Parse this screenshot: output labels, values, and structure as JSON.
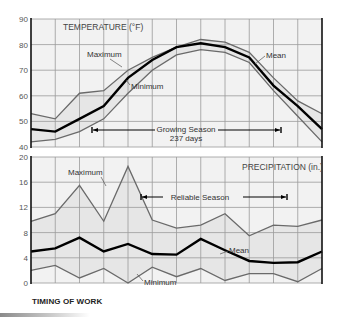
{
  "caption": "TIMING OF WORK",
  "chart_data": [
    {
      "type": "line",
      "title": "TEMPERATURE (°F)",
      "xlabel": "",
      "ylabel": "",
      "ylim": [
        40,
        90
      ],
      "yticks": [
        40,
        50,
        60,
        70,
        80,
        90
      ],
      "grid": true,
      "x": [
        0,
        1,
        2,
        3,
        4,
        5,
        6,
        7,
        8,
        9,
        10,
        11,
        12
      ],
      "series": [
        {
          "name": "Maximum",
          "values": [
            53,
            51,
            61,
            62,
            70,
            75,
            79,
            82,
            81,
            77,
            67,
            58,
            53
          ]
        },
        {
          "name": "Mean",
          "values": [
            47,
            46,
            51,
            56,
            67,
            74,
            79,
            80.5,
            79,
            75,
            64,
            56,
            47
          ]
        },
        {
          "name": "Minimum",
          "values": [
            42,
            43,
            46,
            51,
            61,
            70,
            76,
            78,
            77,
            73,
            62,
            52,
            42
          ]
        }
      ],
      "annotations": [
        {
          "text": "Maximum",
          "series": "Maximum"
        },
        {
          "text": "Minimum",
          "series": "Minimum"
        },
        {
          "text": "Mean",
          "series": "Mean"
        },
        {
          "text": "Growing Season",
          "sub": "237 days",
          "type": "range-bracket",
          "x_start": 2.5,
          "x_end": 10.3
        }
      ]
    },
    {
      "type": "line",
      "title": "PRECIPITATION (in.)",
      "xlabel": "",
      "ylabel": "",
      "ylim": [
        0,
        20
      ],
      "yticks": [
        0,
        4,
        8,
        12,
        16,
        20
      ],
      "grid": true,
      "x": [
        0,
        1,
        2,
        3,
        4,
        5,
        6,
        7,
        8,
        9,
        10,
        11,
        12
      ],
      "series": [
        {
          "name": "Maximum",
          "values": [
            9.8,
            11,
            15.5,
            9.8,
            18.5,
            10,
            8.7,
            9.2,
            11,
            7.5,
            9.2,
            9,
            10
          ]
        },
        {
          "name": "Mean",
          "values": [
            5,
            5.5,
            7.2,
            5,
            6.2,
            4.6,
            4.5,
            7,
            5.2,
            3.5,
            3.2,
            3.3,
            5
          ]
        },
        {
          "name": "Minimum",
          "values": [
            2,
            2.8,
            0.8,
            2.3,
            0,
            2.5,
            1,
            2.3,
            0.4,
            1.5,
            1.5,
            0.2,
            2.3
          ]
        }
      ],
      "annotations": [
        {
          "text": "Maximum",
          "series": "Maximum"
        },
        {
          "text": "Mean",
          "series": "Mean"
        },
        {
          "text": "Minimum",
          "series": "Minimum"
        },
        {
          "text": "Reliable Season",
          "type": "range-bracket",
          "x_start": 4.5,
          "x_end": 10.5
        }
      ]
    }
  ],
  "labels": {
    "temp_title": "TEMPERATURE (°F)",
    "temp_max": "Maximum",
    "temp_min": "Minimum",
    "temp_mean": "Mean",
    "growing": "Growing Season",
    "growing_days": "237 days",
    "precip_title": "PRECIPITATION (in.)",
    "precip_max": "Maximum",
    "precip_mean": "Mean",
    "precip_min": "Minimum",
    "reliable": "Reliable Season"
  },
  "colors": {
    "background": "#ffffff",
    "plot_fill": "#f2f2f2",
    "band_fill": "#e6e6e6",
    "grid": "#9a9a9a",
    "axis": "#111111",
    "max_min_line": "#6a6a6a",
    "mean_line": "#000000"
  }
}
